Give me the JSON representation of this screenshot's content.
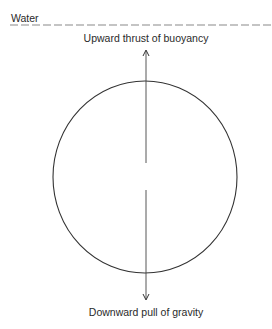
{
  "diagram": {
    "labels": {
      "water": "Water",
      "upward": "Upward thrust of buoyancy",
      "downward": "Downward pull of gravity"
    },
    "elements": {
      "water_surface": {
        "style": "dashed",
        "y": 25,
        "x_start": 10,
        "x_end": 272
      },
      "body": {
        "shape": "circle",
        "cx": 145,
        "cy": 177,
        "rx": 92,
        "ry": 96
      },
      "upward_arrow": {
        "x": 146,
        "from_y": 163,
        "to_y": 50,
        "direction": "up"
      },
      "downward_arrow": {
        "x": 146,
        "from_y": 190,
        "to_y": 300,
        "direction": "down"
      }
    },
    "colors": {
      "stroke": "#333333",
      "dash": "#8a8a8a",
      "text": "#2a2a2a",
      "background": "#ffffff"
    }
  }
}
